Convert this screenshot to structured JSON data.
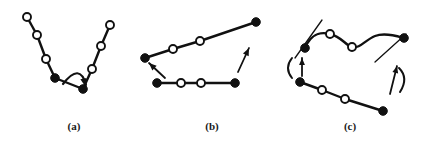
{
  "figure": {
    "type": "scientific-diagram",
    "background_color": "#ffffff",
    "ink_color": "#111111",
    "node_open_fill": "#ffffff",
    "width": 430,
    "height": 144,
    "panels": [
      {
        "id": "a",
        "caption": "(a)",
        "caption_x": 74,
        "caption_y": 130,
        "motion_label": "crankshaft-flip",
        "chains": [
          {
            "name": "v-chain",
            "nodes": [
              {
                "x": 27,
                "y": 17,
                "type": "open"
              },
              {
                "x": 37,
                "y": 35,
                "type": "open"
              },
              {
                "x": 46,
                "y": 59,
                "type": "open"
              },
              {
                "x": 55,
                "y": 78,
                "type": "filled"
              },
              {
                "x": 83,
                "y": 89,
                "type": "filled"
              },
              {
                "x": 92,
                "y": 69,
                "type": "open"
              },
              {
                "x": 101,
                "y": 46,
                "type": "open"
              },
              {
                "x": 110,
                "y": 25,
                "type": "open"
              }
            ]
          }
        ],
        "arrows": [
          {
            "name": "flip-arrow",
            "kind": "curved",
            "path": "M 63 84 Q 80 62 86 85",
            "head_x": 85,
            "head_y": 86,
            "head_angle": 78
          }
        ]
      },
      {
        "id": "b",
        "caption": "(b)",
        "caption_x": 212,
        "caption_y": 130,
        "motion_label": "translation",
        "chains": [
          {
            "name": "upper-chain",
            "nodes": [
              {
                "x": 145,
                "y": 58,
                "type": "filled"
              },
              {
                "x": 173,
                "y": 49,
                "type": "open"
              },
              {
                "x": 200,
                "y": 41,
                "type": "open"
              },
              {
                "x": 256,
                "y": 22,
                "type": "filled"
              }
            ]
          },
          {
            "name": "lower-chain",
            "nodes": [
              {
                "x": 157,
                "y": 83,
                "type": "filled"
              },
              {
                "x": 181,
                "y": 83,
                "type": "open"
              },
              {
                "x": 201,
                "y": 83,
                "type": "open"
              },
              {
                "x": 235,
                "y": 83,
                "type": "filled"
              }
            ]
          }
        ],
        "arrows": [
          {
            "name": "left-motion-arrow",
            "kind": "straight",
            "x1": 165,
            "y1": 78,
            "x2": 149,
            "y2": 63,
            "head_angle": 223
          },
          {
            "name": "right-motion-arrow",
            "kind": "straight",
            "x1": 238,
            "y1": 72,
            "x2": 249,
            "y2": 48,
            "head_angle": -65
          }
        ]
      },
      {
        "id": "c",
        "caption": "(c)",
        "caption_x": 350,
        "caption_y": 130,
        "motion_label": "rotation",
        "chains": [
          {
            "name": "wavy-upper-chain",
            "wavy": true,
            "path": "M 305 48 C 312 32 322 32 330 34 C 342 37 345 45 352 47 C 360 49 365 40 375 36 C 385 32 397 36 404 38",
            "nodes": [
              {
                "x": 305,
                "y": 48,
                "type": "filled"
              },
              {
                "x": 330,
                "y": 34,
                "type": "open"
              },
              {
                "x": 352,
                "y": 47,
                "type": "open"
              },
              {
                "x": 404,
                "y": 38,
                "type": "filled"
              }
            ]
          },
          {
            "name": "lower-chain",
            "nodes": [
              {
                "x": 300,
                "y": 82,
                "type": "filled"
              },
              {
                "x": 322,
                "y": 90,
                "type": "open"
              },
              {
                "x": 345,
                "y": 99,
                "type": "open"
              },
              {
                "x": 383,
                "y": 111,
                "type": "filled"
              }
            ]
          }
        ],
        "tangents": [
          {
            "name": "left-tangent-line",
            "x1": 295,
            "y1": 58,
            "x2": 322,
            "y2": 20
          },
          {
            "name": "right-tangent-line",
            "x1": 375,
            "y1": 62,
            "x2": 406,
            "y2": 34
          }
        ],
        "arrows": [
          {
            "name": "left-rotation-arrow",
            "kind": "rotation",
            "arc_path": "M 292 58 Q 284 68 292 78",
            "shaft_x1": 302,
            "shaft_y1": 76,
            "shaft_x2": 302,
            "shaft_y2": 58,
            "head_angle": -90
          },
          {
            "name": "right-rotation-arrow",
            "kind": "rotation",
            "arc_path": "M 399 68 Q 409 78 400 92",
            "shaft_x1": 390,
            "shaft_y1": 94,
            "shaft_x2": 397,
            "shaft_y2": 66,
            "head_angle": -76
          }
        ]
      }
    ]
  }
}
